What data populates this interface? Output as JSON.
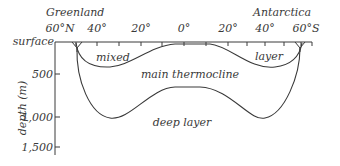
{
  "top_labels": {
    "left_region": "Greenland",
    "right_region": "Antarctica"
  },
  "latitude_ticks": [
    "60°N",
    "40°",
    "20°",
    "0°",
    "20°",
    "40°",
    "60°S"
  ],
  "depth_axis": {
    "label": "depth (m)",
    "surface_label": "surface",
    "ticks": [
      "500",
      "1,000",
      "1,500"
    ]
  },
  "layers": {
    "mixed_left": "mixed",
    "mixed_right": "layer",
    "thermocline": "main thermocline",
    "deep": "deep layer"
  },
  "colors": {
    "line": "#3a3a3a",
    "text": "#3a3a3a",
    "background": "#ffffff"
  }
}
